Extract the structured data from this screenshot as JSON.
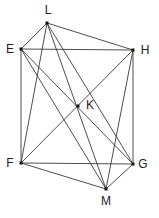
{
  "diagram": {
    "type": "geometric-graph",
    "background": "#ffffff",
    "line_color": "#3a3a3a",
    "point_color": "#111111",
    "points": [
      {
        "id": "L",
        "label": "L",
        "x": 47,
        "y": 23,
        "label_x": 48,
        "label_y": 11
      },
      {
        "id": "E",
        "label": "E",
        "x": 21,
        "y": 49,
        "label_x": 10,
        "label_y": 50
      },
      {
        "id": "H",
        "label": "H",
        "x": 133,
        "y": 50,
        "label_x": 145,
        "label_y": 51
      },
      {
        "id": "K",
        "label": "K",
        "x": 78,
        "y": 106,
        "label_x": 90,
        "label_y": 106
      },
      {
        "id": "F",
        "label": "F",
        "x": 21,
        "y": 163,
        "label_x": 10,
        "label_y": 164
      },
      {
        "id": "G",
        "label": "G",
        "x": 133,
        "y": 164,
        "label_x": 143,
        "label_y": 165
      },
      {
        "id": "M",
        "label": "M",
        "x": 106,
        "y": 189,
        "label_x": 106,
        "label_y": 202
      }
    ],
    "edges": [
      [
        "L",
        "E"
      ],
      [
        "L",
        "H"
      ],
      [
        "L",
        "F"
      ],
      [
        "L",
        "M"
      ],
      [
        "L",
        "G"
      ],
      [
        "E",
        "H"
      ],
      [
        "E",
        "F"
      ],
      [
        "E",
        "G"
      ],
      [
        "E",
        "M"
      ],
      [
        "H",
        "G"
      ],
      [
        "H",
        "F"
      ],
      [
        "H",
        "M"
      ],
      [
        "F",
        "G"
      ],
      [
        "F",
        "M"
      ],
      [
        "G",
        "M"
      ]
    ]
  }
}
